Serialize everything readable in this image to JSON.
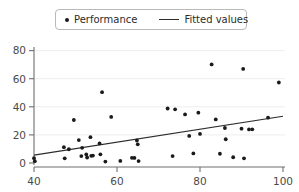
{
  "legend": {
    "entries": [
      {
        "label": "Performance",
        "marker": "dot-marker-icon",
        "color": "#1a1a1a"
      },
      {
        "label": "Fitted values",
        "marker": "line-marker-icon",
        "color": "#2b2b2b"
      }
    ]
  },
  "chart_data": {
    "type": "scatter",
    "title": "",
    "xlabel": "",
    "ylabel": "",
    "xlim": [
      40,
      100
    ],
    "ylim": [
      0,
      84
    ],
    "xticks": [
      40,
      60,
      80,
      100
    ],
    "yticks": [
      0,
      20,
      40,
      60,
      80
    ],
    "grid": "horizontal",
    "legend_position": "top-center",
    "series": [
      {
        "name": "Performance",
        "type": "scatter",
        "marker": "circle",
        "color": "#1a1a1a",
        "points": [
          [
            40.0,
            3.4
          ],
          [
            40.2,
            1.3
          ],
          [
            47.2,
            11.3
          ],
          [
            47.4,
            3.3
          ],
          [
            48.4,
            9.8
          ],
          [
            49.6,
            30.6
          ],
          [
            50.8,
            16.3
          ],
          [
            51.4,
            4.9
          ],
          [
            51.6,
            10.8
          ],
          [
            52.6,
            6.1
          ],
          [
            52.8,
            3.9
          ],
          [
            53.6,
            18.4
          ],
          [
            53.8,
            5.1
          ],
          [
            54.2,
            5.3
          ],
          [
            55.8,
            13.9
          ],
          [
            56.0,
            6.2
          ],
          [
            56.4,
            50.4
          ],
          [
            57.2,
            1.0
          ],
          [
            58.6,
            32.8
          ],
          [
            60.8,
            1.5
          ],
          [
            63.6,
            3.7
          ],
          [
            64.2,
            3.6
          ],
          [
            64.8,
            16.0
          ],
          [
            65.0,
            13.3
          ],
          [
            65.2,
            1.4
          ],
          [
            72.2,
            38.8
          ],
          [
            73.4,
            4.9
          ],
          [
            74.0,
            38.2
          ],
          [
            76.4,
            34.6
          ],
          [
            77.4,
            19.3
          ],
          [
            78.4,
            6.8
          ],
          [
            79.6,
            35.8
          ],
          [
            80.0,
            20.7
          ],
          [
            82.8,
            70.2
          ],
          [
            83.8,
            31.0
          ],
          [
            84.8,
            6.6
          ],
          [
            86.0,
            24.9
          ],
          [
            86.2,
            16.9
          ],
          [
            88.0,
            4.1
          ],
          [
            90.0,
            24.4
          ],
          [
            90.4,
            67.0
          ],
          [
            90.6,
            3.3
          ],
          [
            91.8,
            23.9
          ],
          [
            92.6,
            24.0
          ],
          [
            96.4,
            32.3
          ],
          [
            99.0,
            57.3
          ]
        ]
      },
      {
        "name": "Fitted values",
        "type": "line",
        "color": "#2b2b2b",
        "points": [
          [
            40,
            5.6
          ],
          [
            100,
            33.3
          ]
        ]
      }
    ]
  }
}
